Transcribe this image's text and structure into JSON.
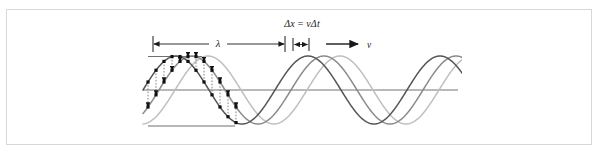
{
  "figure": {
    "type": "physics-wave-propagation-diagram",
    "frame": {
      "border_color": "#d8d8d8",
      "background": "#ffffff"
    },
    "labels": {
      "wavelength": "λ",
      "displacement": "Δx = vΔt",
      "velocity": "v"
    },
    "annotations": {
      "wavelength_dimension": {
        "name": "wavelength-dimension-arrow",
        "x_start": 153,
        "x_end": 285,
        "y": 44
      },
      "displacement_dimension": {
        "name": "displacement-dimension-arrow",
        "x_start": 293,
        "x_end": 309,
        "y": 44
      },
      "velocity_arrow": {
        "name": "velocity-arrow",
        "x_start": 326,
        "x_end": 360,
        "y": 44
      }
    },
    "axis": {
      "zero_line": {
        "x_start": 143,
        "x_end": 458,
        "y": 90
      },
      "crest_line": {
        "x_start": 148,
        "x_end": 200,
        "y": 57
      },
      "trough_line": {
        "x_start": 148,
        "x_end": 232,
        "y": 126
      }
    },
    "colors": {
      "wave_dark": "#555555",
      "wave_mid": "#8a8a8a",
      "wave_light": "#bfbfbf",
      "marker": "#111111",
      "dotted": "#777777",
      "axis": "#777777",
      "frame": "#d8d8d8",
      "text": "#1a1a1a"
    }
  },
  "chart_data": {
    "type": "line",
    "title": "",
    "xlabel": "",
    "ylabel": "",
    "axis_y_zero": 90,
    "amplitude_px": 34,
    "wavelength_px": 132,
    "shift_px": 16,
    "x_domain": [
      143,
      458
    ],
    "series": [
      {
        "name": "wave-snapshot-1",
        "color": "#555555",
        "phase_shift_px": 0,
        "stroke": 1.5
      },
      {
        "name": "wave-snapshot-2",
        "color": "#8a8a8a",
        "phase_shift_px": 16,
        "stroke": 1.5
      },
      {
        "name": "wave-snapshot-3",
        "color": "#bfbfbf",
        "phase_shift_px": 32,
        "stroke": 1.5
      }
    ],
    "markers": {
      "name": "particle-displacement-markers",
      "shape": "square",
      "color": "#111111",
      "x_positions": [
        148,
        156,
        164,
        172,
        180,
        188,
        196,
        204,
        212,
        220,
        228,
        236
      ]
    },
    "legend": {
      "visible": false
    },
    "grid": false
  }
}
